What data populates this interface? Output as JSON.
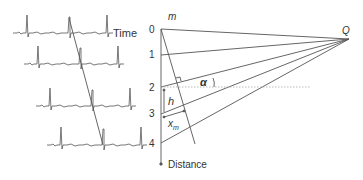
{
  "left_panel": {
    "time_label": "Time",
    "trace_count": 4
  },
  "right_panel": {
    "axis_top_label": "m",
    "axis_bottom_label": "Distance",
    "point_labels": [
      "0",
      "1",
      "2",
      "3",
      "4"
    ],
    "source_label": "Q",
    "angle_label": "α",
    "height_label": "h",
    "offset_label": "x",
    "offset_subscript": "m"
  },
  "colors": {
    "line": "#555555",
    "text": "#333333",
    "dotted": "#aaaaaa"
  }
}
